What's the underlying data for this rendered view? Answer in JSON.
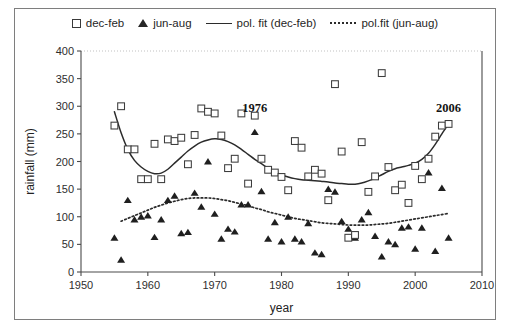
{
  "chart_data": {
    "type": "scatter",
    "title": "",
    "xlabel": "year",
    "ylabel": "rainfall (mm)",
    "xlim": [
      1950,
      2010
    ],
    "ylim": [
      0,
      400
    ],
    "xticks": [
      "1950",
      "1960",
      "1970",
      "1980",
      "1990",
      "2000",
      "2010"
    ],
    "yticks": [
      "0",
      "50",
      "100",
      "150",
      "200",
      "250",
      "300",
      "350",
      "400"
    ],
    "grid": false,
    "legend_position": "top",
    "legend": [
      {
        "label": "dec-feb",
        "marker": "open-square"
      },
      {
        "label": "jun-aug",
        "marker": "filled-triangle"
      },
      {
        "label": "pol. fit (dec-feb)",
        "marker": "solid-line"
      },
      {
        "label": "pol.fit (jun-aug)",
        "marker": "dotted-line"
      }
    ],
    "annotations": [
      {
        "text": "1976",
        "x": 1976,
        "y": 290
      },
      {
        "text": "2006",
        "x": 2005,
        "y": 290
      }
    ],
    "series": [
      {
        "name": "dec-feb",
        "marker": "open-square",
        "points": [
          [
            1955,
            265
          ],
          [
            1956,
            300
          ],
          [
            1957,
            222
          ],
          [
            1958,
            222
          ],
          [
            1959,
            168
          ],
          [
            1960,
            168
          ],
          [
            1961,
            232
          ],
          [
            1962,
            168
          ],
          [
            1963,
            240
          ],
          [
            1964,
            237
          ],
          [
            1965,
            243
          ],
          [
            1966,
            195
          ],
          [
            1967,
            248
          ],
          [
            1968,
            296
          ],
          [
            1969,
            290
          ],
          [
            1970,
            287
          ],
          [
            1971,
            247
          ],
          [
            1972,
            188
          ],
          [
            1973,
            205
          ],
          [
            1974,
            287
          ],
          [
            1975,
            160
          ],
          [
            1976,
            283
          ],
          [
            1977,
            205
          ],
          [
            1978,
            185
          ],
          [
            1979,
            180
          ],
          [
            1980,
            172
          ],
          [
            1981,
            148
          ],
          [
            1982,
            237
          ],
          [
            1983,
            225
          ],
          [
            1984,
            173
          ],
          [
            1985,
            185
          ],
          [
            1986,
            178
          ],
          [
            1987,
            130
          ],
          [
            1988,
            340
          ],
          [
            1989,
            218
          ],
          [
            1990,
            62
          ],
          [
            1991,
            67
          ],
          [
            1992,
            235
          ],
          [
            1993,
            145
          ],
          [
            1994,
            173
          ],
          [
            1995,
            360
          ],
          [
            1996,
            190
          ],
          [
            1997,
            148
          ],
          [
            1998,
            158
          ],
          [
            1999,
            125
          ],
          [
            2000,
            192
          ],
          [
            2001,
            168
          ],
          [
            2002,
            205
          ],
          [
            2003,
            245
          ],
          [
            2004,
            265
          ],
          [
            2005,
            268
          ]
        ]
      },
      {
        "name": "jun-aug",
        "marker": "filled-triangle",
        "points": [
          [
            1955,
            62
          ],
          [
            1956,
            22
          ],
          [
            1957,
            130
          ],
          [
            1958,
            95
          ],
          [
            1959,
            100
          ],
          [
            1960,
            102
          ],
          [
            1961,
            63
          ],
          [
            1962,
            95
          ],
          [
            1963,
            130
          ],
          [
            1964,
            138
          ],
          [
            1965,
            70
          ],
          [
            1966,
            72
          ],
          [
            1967,
            143
          ],
          [
            1968,
            118
          ],
          [
            1969,
            200
          ],
          [
            1970,
            105
          ],
          [
            1971,
            60
          ],
          [
            1972,
            78
          ],
          [
            1973,
            73
          ],
          [
            1974,
            122
          ],
          [
            1975,
            122
          ],
          [
            1976,
            253
          ],
          [
            1977,
            146
          ],
          [
            1978,
            60
          ],
          [
            1979,
            90
          ],
          [
            1980,
            55
          ],
          [
            1981,
            100
          ],
          [
            1982,
            60
          ],
          [
            1983,
            55
          ],
          [
            1984,
            88
          ],
          [
            1985,
            35
          ],
          [
            1986,
            32
          ],
          [
            1987,
            150
          ],
          [
            1988,
            145
          ],
          [
            1989,
            92
          ],
          [
            1990,
            78
          ],
          [
            1991,
            62
          ],
          [
            1992,
            95
          ],
          [
            1993,
            108
          ],
          [
            1994,
            65
          ],
          [
            1995,
            28
          ],
          [
            1996,
            55
          ],
          [
            1997,
            50
          ],
          [
            1998,
            80
          ],
          [
            1999,
            82
          ],
          [
            2000,
            42
          ],
          [
            2001,
            80
          ],
          [
            2002,
            180
          ],
          [
            2003,
            38
          ],
          [
            2004,
            152
          ],
          [
            2005,
            62
          ]
        ]
      }
    ],
    "fits": [
      {
        "name": "pol. fit (dec-feb)",
        "style": "solid",
        "points": [
          [
            1955,
            290
          ],
          [
            1956,
            252
          ],
          [
            1957,
            222
          ],
          [
            1958,
            202
          ],
          [
            1959,
            190
          ],
          [
            1960,
            182
          ],
          [
            1961,
            178
          ],
          [
            1962,
            179
          ],
          [
            1963,
            186
          ],
          [
            1964,
            197
          ],
          [
            1965,
            208
          ],
          [
            1966,
            219
          ],
          [
            1967,
            228
          ],
          [
            1968,
            235
          ],
          [
            1969,
            239
          ],
          [
            1970,
            241
          ],
          [
            1971,
            240
          ],
          [
            1972,
            236
          ],
          [
            1973,
            230
          ],
          [
            1974,
            222
          ],
          [
            1975,
            213
          ],
          [
            1976,
            204
          ],
          [
            1977,
            196
          ],
          [
            1978,
            188
          ],
          [
            1979,
            181
          ],
          [
            1980,
            176
          ],
          [
            1981,
            172
          ],
          [
            1982,
            169
          ],
          [
            1983,
            167
          ],
          [
            1984,
            166
          ],
          [
            1985,
            165
          ],
          [
            1986,
            164
          ],
          [
            1987,
            163
          ],
          [
            1988,
            161
          ],
          [
            1989,
            160
          ],
          [
            1990,
            159
          ],
          [
            1991,
            159
          ],
          [
            1992,
            161
          ],
          [
            1993,
            165
          ],
          [
            1994,
            170
          ],
          [
            1995,
            176
          ],
          [
            1996,
            182
          ],
          [
            1997,
            187
          ],
          [
            1998,
            190
          ],
          [
            1999,
            193
          ],
          [
            2000,
            197
          ],
          [
            2001,
            204
          ],
          [
            2002,
            215
          ],
          [
            2003,
            231
          ],
          [
            2004,
            250
          ],
          [
            2005,
            268
          ]
        ]
      },
      {
        "name": "pol.fit (jun-aug)",
        "style": "dotted",
        "points": [
          [
            1956,
            92
          ],
          [
            1957,
            97
          ],
          [
            1958,
            102
          ],
          [
            1959,
            107
          ],
          [
            1960,
            112
          ],
          [
            1961,
            117
          ],
          [
            1962,
            121
          ],
          [
            1963,
            125
          ],
          [
            1964,
            128
          ],
          [
            1965,
            131
          ],
          [
            1966,
            133
          ],
          [
            1967,
            134
          ],
          [
            1968,
            134
          ],
          [
            1969,
            134
          ],
          [
            1970,
            133
          ],
          [
            1971,
            131
          ],
          [
            1972,
            129
          ],
          [
            1973,
            126
          ],
          [
            1974,
            123
          ],
          [
            1975,
            120
          ],
          [
            1976,
            116
          ],
          [
            1977,
            113
          ],
          [
            1978,
            109
          ],
          [
            1979,
            106
          ],
          [
            1980,
            103
          ],
          [
            1981,
            100
          ],
          [
            1982,
            97
          ],
          [
            1983,
            95
          ],
          [
            1984,
            93
          ],
          [
            1985,
            91
          ],
          [
            1986,
            89
          ],
          [
            1987,
            88
          ],
          [
            1988,
            87
          ],
          [
            1989,
            86
          ],
          [
            1990,
            85
          ],
          [
            1991,
            85
          ],
          [
            1992,
            85
          ],
          [
            1993,
            85
          ],
          [
            1994,
            86
          ],
          [
            1995,
            87
          ],
          [
            1996,
            88
          ],
          [
            1997,
            90
          ],
          [
            1998,
            92
          ],
          [
            1999,
            94
          ],
          [
            2000,
            96
          ],
          [
            2001,
            98
          ],
          [
            2002,
            100
          ],
          [
            2003,
            102
          ],
          [
            2004,
            104
          ],
          [
            2005,
            106
          ]
        ]
      }
    ]
  }
}
